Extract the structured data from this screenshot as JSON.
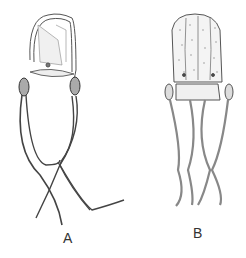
{
  "figure": {
    "specimens": [
      {
        "label": "A",
        "description": "Box jellyfish with smooth transparent bell, four pedalia and long trailing tentacles"
      },
      {
        "label": "B",
        "description": "Box jellyfish with stippled, ridged bell and four shorter beaded tentacles"
      }
    ]
  }
}
